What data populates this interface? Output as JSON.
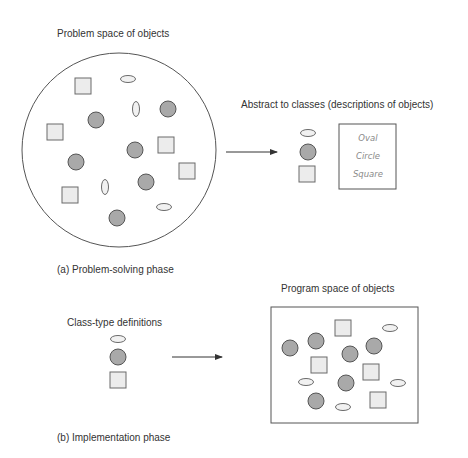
{
  "colors": {
    "text": "#333333",
    "class_text": "#8a8a8a",
    "circle_fill": "#a9a9a9",
    "square_fill": "#ececec",
    "oval_fill": "#f1f1f1",
    "outline": "#555555"
  },
  "phase_a": {
    "title": "Problem space of objects",
    "caption": "(a) Problem-solving phase",
    "abstract_label": "Abstract to classes (descriptions of objects)",
    "class_names": [
      "Oval",
      "Circle",
      "Square"
    ],
    "problem_space": {
      "shape": "circle",
      "cx": 119,
      "cy": 150,
      "r": 97,
      "objects": [
        {
          "type": "square",
          "x": 75,
          "y": 78
        },
        {
          "type": "oval",
          "cx": 128,
          "cy": 79,
          "orient": "h"
        },
        {
          "type": "oval",
          "cx": 136,
          "cy": 109,
          "orient": "v"
        },
        {
          "type": "circle",
          "cx": 168,
          "cy": 109
        },
        {
          "type": "circle",
          "cx": 96,
          "cy": 120
        },
        {
          "type": "square",
          "x": 47,
          "y": 124
        },
        {
          "type": "circle",
          "cx": 135,
          "cy": 150
        },
        {
          "type": "square",
          "x": 158,
          "y": 137
        },
        {
          "type": "circle",
          "cx": 76,
          "cy": 162
        },
        {
          "type": "square",
          "x": 179,
          "y": 163
        },
        {
          "type": "oval",
          "cx": 105,
          "cy": 187,
          "orient": "v"
        },
        {
          "type": "circle",
          "cx": 146,
          "cy": 182
        },
        {
          "type": "square",
          "x": 62,
          "y": 187
        },
        {
          "type": "oval",
          "cx": 164,
          "cy": 207,
          "orient": "h"
        },
        {
          "type": "circle",
          "cx": 117,
          "cy": 218
        }
      ]
    },
    "legend_objects": [
      {
        "type": "oval",
        "cx": 308,
        "cy": 133,
        "orient": "h"
      },
      {
        "type": "circle",
        "cx": 308,
        "cy": 152
      },
      {
        "type": "square",
        "x": 299,
        "y": 166
      }
    ]
  },
  "phase_b": {
    "title": "Program space of objects",
    "caption": "(b) Implementation phase",
    "definitions_label": "Class-type definitions",
    "definition_objects": [
      {
        "type": "oval",
        "cx": 118,
        "cy": 339,
        "orient": "h"
      },
      {
        "type": "circle",
        "cx": 118,
        "cy": 357
      },
      {
        "type": "square",
        "x": 110,
        "y": 372
      }
    ],
    "program_space": {
      "shape": "rect",
      "x": 271,
      "y": 307,
      "w": 147,
      "h": 116,
      "objects": [
        {
          "type": "square",
          "x": 335,
          "y": 320
        },
        {
          "type": "oval",
          "cx": 390,
          "cy": 328,
          "orient": "h"
        },
        {
          "type": "circle",
          "cx": 290,
          "cy": 348
        },
        {
          "type": "circle",
          "cx": 316,
          "cy": 341
        },
        {
          "type": "circle",
          "cx": 350,
          "cy": 354
        },
        {
          "type": "circle",
          "cx": 374,
          "cy": 346
        },
        {
          "type": "square",
          "x": 311,
          "y": 357
        },
        {
          "type": "square",
          "x": 363,
          "y": 364
        },
        {
          "type": "oval",
          "cx": 306,
          "cy": 382,
          "orient": "h"
        },
        {
          "type": "circle",
          "cx": 346,
          "cy": 383
        },
        {
          "type": "oval",
          "cx": 398,
          "cy": 383,
          "orient": "h"
        },
        {
          "type": "circle",
          "cx": 316,
          "cy": 401
        },
        {
          "type": "square",
          "x": 370,
          "y": 392
        },
        {
          "type": "oval",
          "cx": 343,
          "cy": 407,
          "orient": "h"
        }
      ]
    }
  }
}
